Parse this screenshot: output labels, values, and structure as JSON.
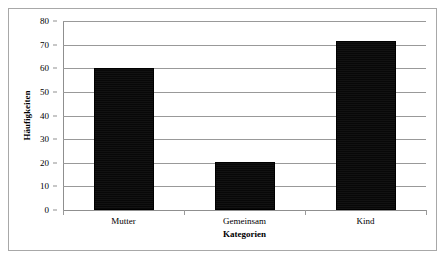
{
  "chart_data": {
    "type": "bar",
    "title": "",
    "subtitle": "",
    "categories": [
      "Mutter",
      "Gemeinsam",
      "Kind"
    ],
    "values": [
      60,
      20.5,
      71.5
    ],
    "series": [
      {
        "name": "Häufigkeiten",
        "values": [
          60,
          20.5,
          71.5
        ]
      }
    ],
    "xlabel": "Kategorien",
    "ylabel": "Häufigkeiten",
    "ylim": [
      0,
      80
    ],
    "yticks": [
      0,
      10,
      20,
      30,
      40,
      50,
      60,
      70,
      80
    ],
    "ytick_labels": [
      "0",
      "10",
      "20",
      "30",
      "40",
      "50",
      "60",
      "70",
      "80"
    ],
    "grid": "horizontal",
    "legend": "none",
    "bar_color": "#0d0d0d",
    "gridline_color": "#999999",
    "axis_color": "#8f8f8f",
    "frame_color": "#a8a8a8",
    "background_color": "#ffffff",
    "annotations": []
  },
  "axes": {
    "y_title": "Häufigkeiten",
    "x_title": "Kategorien"
  },
  "ticks": {
    "y": [
      {
        "label": "80",
        "value": 80
      },
      {
        "label": "70",
        "value": 70
      },
      {
        "label": "60",
        "value": 60
      },
      {
        "label": "50",
        "value": 50
      },
      {
        "label": "40",
        "value": 40
      },
      {
        "label": "30",
        "value": 30
      },
      {
        "label": "20",
        "value": 20
      },
      {
        "label": "10",
        "value": 10
      },
      {
        "label": "0",
        "value": 0
      }
    ]
  },
  "bars": [
    {
      "label": "Mutter",
      "value": 60
    },
    {
      "label": "Gemeinsam",
      "value": 20.5
    },
    {
      "label": "Kind",
      "value": 71.5
    }
  ]
}
